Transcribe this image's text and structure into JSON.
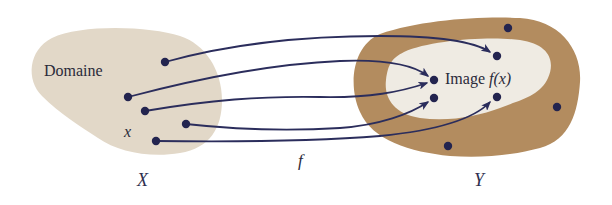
{
  "diagram": {
    "type": "function-mapping",
    "domain_set": {
      "name": "X",
      "region_label": "Domaine",
      "element_label": "x",
      "fill_color": "#e2d8c8",
      "points": [
        {
          "id": "d1",
          "x": 165,
          "y": 62
        },
        {
          "id": "d2",
          "x": 128,
          "y": 97
        },
        {
          "id": "d3",
          "x": 145,
          "y": 111
        },
        {
          "id": "d4",
          "x": 186,
          "y": 124
        },
        {
          "id": "d5",
          "x": 156,
          "y": 141
        }
      ]
    },
    "codomain_set": {
      "name": "Y",
      "fill_color": "#b38c5f",
      "image_region": {
        "label_text": "Image ",
        "label_math": "f(x)",
        "fill_color": "#efebe3"
      },
      "image_points": [
        {
          "id": "i1",
          "x": 497,
          "y": 56
        },
        {
          "id": "i2",
          "x": 434,
          "y": 80
        },
        {
          "id": "i3",
          "x": 434,
          "y": 98
        },
        {
          "id": "i4",
          "x": 497,
          "y": 97
        }
      ],
      "outside_points": [
        {
          "id": "o1",
          "x": 508,
          "y": 28
        },
        {
          "id": "o2",
          "x": 557,
          "y": 107
        },
        {
          "id": "o3",
          "x": 448,
          "y": 146
        }
      ]
    },
    "function": {
      "name": "f",
      "arrow_color": "#2b2d5c",
      "mappings": [
        {
          "from": "d1",
          "to": "i1"
        },
        {
          "from": "d2",
          "to": "i2"
        },
        {
          "from": "d3",
          "to": "i2"
        },
        {
          "from": "d4",
          "to": "i3"
        },
        {
          "from": "d5",
          "to": "i4"
        }
      ]
    },
    "point_color": "#23244f"
  }
}
